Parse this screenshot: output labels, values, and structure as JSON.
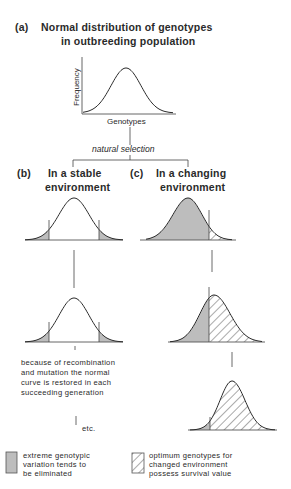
{
  "panel_a": {
    "label": "(a)",
    "title_line1": "Normal distribution of genotypes",
    "title_line2": "in outbreeding population",
    "y_axis_label": "Frequency",
    "x_axis_label": "Genotypes"
  },
  "connector": {
    "label": "natural selection"
  },
  "panel_b": {
    "label": "(b)",
    "title_line1": "In a stable",
    "title_line2": "environment",
    "note_lines": [
      "because of recombination",
      "and mutation the normal",
      "curve is restored in each",
      "succeeding generation"
    ],
    "etc": "etc."
  },
  "panel_c": {
    "label": "(c)",
    "title_line1": "In a changing",
    "title_line2": "environment"
  },
  "legend": {
    "shaded": {
      "lines": [
        "extreme genotypic",
        "variation tends to",
        "be eliminated"
      ],
      "color": "#bdbdbd"
    },
    "hatched": {
      "lines": [
        "optimum genotypes for",
        "changed environment",
        "possess survival value"
      ]
    }
  },
  "colors": {
    "ink": "#2a2a2a",
    "shade": "#bdbdbd",
    "background": "#ffffff"
  }
}
